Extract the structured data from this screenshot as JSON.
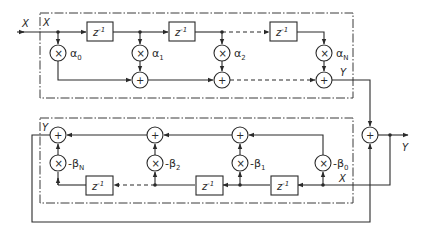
{
  "diagram": {
    "type": "digital-filter-block-diagram",
    "signals": {
      "input_outer": "X",
      "input_inner_top": "X",
      "output_top": "Y",
      "input_inner_bottom": "X",
      "output_inner_bottom": "Y",
      "output_outer": "Y"
    },
    "delay_label": "z",
    "delay_exponent": "-1",
    "multiply_symbol": "×",
    "add_symbol": "+",
    "top_section": {
      "coefficients": [
        {
          "name": "α",
          "sub": "0"
        },
        {
          "name": "α",
          "sub": "1"
        },
        {
          "name": "α",
          "sub": "2"
        },
        {
          "name": "α",
          "sub": "N"
        }
      ]
    },
    "bottom_section": {
      "coefficients": [
        {
          "name": "-β",
          "sub": "N"
        },
        {
          "name": "-β",
          "sub": "2"
        },
        {
          "name": "-β",
          "sub": "1"
        },
        {
          "name": "-β",
          "sub": "0"
        }
      ]
    }
  }
}
